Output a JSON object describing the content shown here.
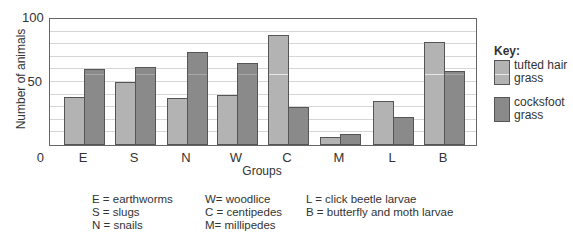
{
  "chart_data": {
    "type": "bar",
    "title": "",
    "xlabel": "Groups",
    "ylabel": "Number of animals",
    "ylim": [
      0,
      100
    ],
    "yticks": [
      0,
      50,
      100
    ],
    "grid": true,
    "legend_position": "right",
    "legend_title": "Key:",
    "categories": [
      "E",
      "S",
      "N",
      "W",
      "C",
      "M",
      "L",
      "B"
    ],
    "series": [
      {
        "name": "tufted hair grass",
        "color": "#b3b3b3",
        "values": [
          38,
          50,
          37,
          40,
          87,
          6,
          35,
          82
        ]
      },
      {
        "name": "cocksfoot grass",
        "color": "#8a8a8a",
        "values": [
          60,
          62,
          74,
          65,
          30,
          9,
          22,
          59
        ]
      }
    ],
    "category_key": [
      "E = earthworms",
      "S = slugs",
      "N = snails",
      "W= woodlice",
      "C = centipedes",
      "M= millipedes",
      "L = click beetle larvae",
      "B = butterfly and moth larvae"
    ]
  },
  "axis": {
    "y0": "0",
    "y50": "50",
    "y100": "100",
    "ylabel": "Number of animals",
    "xlabel": "Groups"
  },
  "legend": {
    "title": "Key:",
    "tufted": "tufted hair grass",
    "cocksfoot": "cocksfoot grass"
  },
  "abbreviations": {
    "col1": [
      "E = earthworms",
      "S = slugs",
      "N = snails"
    ],
    "col2": [
      "W= woodlice",
      "C = centipedes",
      "M= millipedes"
    ],
    "col3": [
      "L = click beetle larvae",
      "B = butterfly and moth larvae"
    ]
  }
}
